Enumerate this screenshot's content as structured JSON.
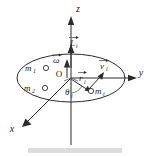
{
  "figure": {
    "background_color": "#ffffff",
    "line_color": "#2b2b2b",
    "caption_bar_color": "#dcdcdc"
  },
  "axes": [
    {
      "name": "z-axis",
      "label": "z",
      "direction": "up",
      "label_x": 78,
      "label_y": 12
    },
    {
      "name": "y-axis",
      "label": "y",
      "direction": "right",
      "label_x": 141,
      "label_y": 76
    },
    {
      "name": "x-axis",
      "label": "x",
      "direction": "down-left",
      "label_x": 12,
      "label_y": 132
    }
  ],
  "origin": {
    "label": "O",
    "label_x": 59,
    "label_y": 77,
    "x": 71,
    "y": 79
  },
  "vectors": [
    {
      "name": "angular-momentum-vector",
      "symbol": "L",
      "subscript": "i",
      "overbar": "arrow",
      "label_x": 74,
      "label_y": 45,
      "direction": "up-along-z"
    },
    {
      "name": "angular-velocity-vector",
      "symbol": "ω",
      "subscript": "",
      "overbar": "arrow",
      "label_x": 57,
      "label_y": 62,
      "direction": "up-along-z"
    },
    {
      "name": "position-vector",
      "symbol": "r",
      "subscript": "i",
      "overbar": "arrow",
      "label_x": 81,
      "label_y": 80,
      "direction": "origin-to-mass"
    },
    {
      "name": "velocity-vector",
      "symbol": "v",
      "subscript": "i",
      "overbar": "arrow",
      "label_x": 102,
      "label_y": 69,
      "direction": "up-right-tangential"
    }
  ],
  "angle": {
    "name": "theta-angle",
    "symbol": "θ",
    "subscript": "i",
    "label_x": 69,
    "label_y": 93
  },
  "masses": [
    {
      "name": "mass-m1",
      "symbol": "m",
      "subscript": "1",
      "label_x": 28,
      "label_y": 71,
      "dot_x": 46,
      "dot_y": 68
    },
    {
      "name": "mass-m2",
      "symbol": "m",
      "subscript": "2",
      "label_x": 27,
      "label_y": 91,
      "dot_x": 45,
      "dot_y": 88
    },
    {
      "name": "mass-mi",
      "symbol": "m",
      "subscript": "i",
      "label_x": 97,
      "label_y": 94,
      "dot_x": 91,
      "dot_y": 91
    }
  ],
  "ellipse": {
    "name": "rotation-plane-ellipse",
    "cx": 71,
    "cy": 78,
    "rx": 54,
    "ry": 24
  }
}
